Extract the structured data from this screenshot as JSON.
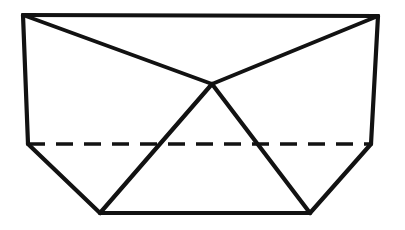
{
  "figure": {
    "canvas": {
      "width": 405,
      "height": 230,
      "background": "#ffffff"
    },
    "stroke_color": "#121212",
    "fill_color": "#ffffff",
    "solid_stroke_width": 4.2,
    "hidden_stroke_width": 3.6,
    "hidden_dash_pattern": "17 11",
    "vertices": {
      "top_left": {
        "label": "top-left",
        "x": 23,
        "y": 15
      },
      "top_right": {
        "label": "top-right",
        "x": 378,
        "y": 16
      },
      "mid_left": {
        "label": "mid-left",
        "x": 28,
        "y": 144
      },
      "mid_right": {
        "label": "mid-right",
        "x": 371,
        "y": 144
      },
      "bottom_left": {
        "label": "bottom-left",
        "x": 100,
        "y": 213
      },
      "bottom_right": {
        "label": "bottom-right",
        "x": 310,
        "y": 213
      },
      "apex": {
        "label": "center-apex",
        "x": 212,
        "y": 84
      }
    },
    "faces": [
      {
        "name": "upper-left-face",
        "points": "23,15 212,84 28,144"
      },
      {
        "name": "upper-right-face",
        "points": "378,16 371,144 212,84"
      },
      {
        "name": "top-face",
        "points": "23,15 378,16 212,84"
      },
      {
        "name": "center-face",
        "points": "212,84 310,213 100,213"
      },
      {
        "name": "lower-left-face",
        "points": "28,144 100,213 212,84"
      },
      {
        "name": "lower-right-face",
        "points": "371,144 212,84 310,213"
      }
    ],
    "edges_solid": [
      {
        "name": "top-edge",
        "d": "M 23,15 L 378,16"
      },
      {
        "name": "left-edge",
        "d": "M 23,15 L 28,144"
      },
      {
        "name": "right-edge",
        "d": "M 378,16 L 371,144"
      },
      {
        "name": "lower-left-slant-edge",
        "d": "M 28,144 L 100,213"
      },
      {
        "name": "lower-right-slant-edge",
        "d": "M 371,144 L 310,213"
      },
      {
        "name": "bottom-edge",
        "d": "M 100,213 L 310,213"
      },
      {
        "name": "apex-to-top-left-edge",
        "d": "M 212,84 L 23,15"
      },
      {
        "name": "apex-to-top-right-edge",
        "d": "M 212,84 L 378,16"
      },
      {
        "name": "apex-to-bottom-left-edge",
        "d": "M 212,84 L 100,213"
      },
      {
        "name": "apex-to-bottom-right-edge",
        "d": "M 212,84 L 310,213"
      }
    ],
    "edges_hidden": [
      {
        "name": "hidden-horizontal-edge",
        "d": "M 28,144 L 371,144"
      }
    ]
  }
}
